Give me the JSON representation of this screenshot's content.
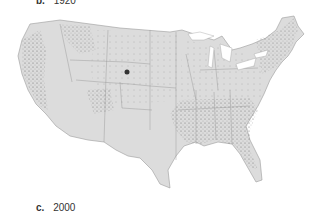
{
  "panels": [
    {
      "letter": "b.",
      "year": "1920"
    },
    {
      "letter": "c.",
      "year": "2000"
    }
  ],
  "map": {
    "subject": "contiguous United States dot-distribution map",
    "land_color": "#d9d9d9",
    "border_color": "#8a8a8a",
    "dot_color": "#555555",
    "water_color": "#ffffff"
  }
}
